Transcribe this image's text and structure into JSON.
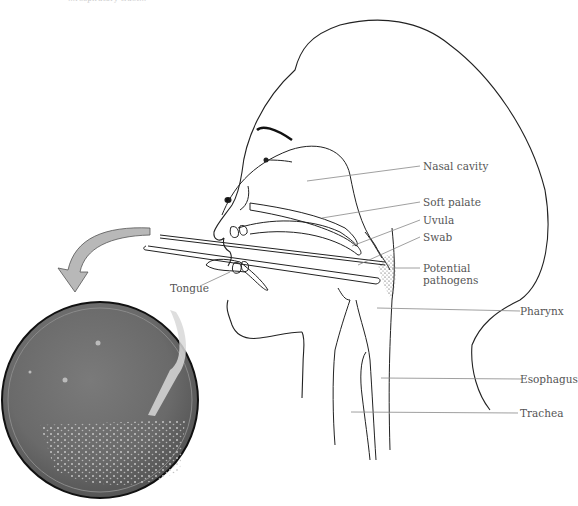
{
  "figure": {
    "caption_top": "…respiratory tract…"
  },
  "labels": {
    "nasal_cavity": "Nasal cavity",
    "soft_palate": "Soft palate",
    "uvula": "Uvula",
    "swab": "Swab",
    "potential_pathogens_line1": "Potential",
    "potential_pathogens_line2": "pathogens",
    "pharynx": "Pharynx",
    "esophagus": "Esophagus",
    "trachea": "Trachea",
    "tongue": "Tongue"
  },
  "colors": {
    "line": "#222222",
    "leader": "#888888",
    "arrow_fill": "#b8b8b8",
    "dish_fill": "#6a6a6a",
    "stipple": "#333333"
  }
}
